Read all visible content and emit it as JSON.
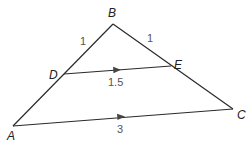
{
  "figure": {
    "type": "triangle-with-midsegment",
    "colors": {
      "line": "#2a2a2a",
      "vertex_label": "#222222",
      "length_label": "#555555",
      "background": "#ffffff"
    },
    "vertices": {
      "A": {
        "label": "A",
        "x": 13,
        "y": 126
      },
      "B": {
        "label": "B",
        "x": 113,
        "y": 24
      },
      "C": {
        "label": "C",
        "x": 233,
        "y": 109
      },
      "D": {
        "label": "D",
        "x": 64,
        "y": 74
      },
      "E": {
        "label": "E",
        "x": 171,
        "y": 66
      }
    },
    "segments": [
      {
        "name": "BD",
        "length_label": "1"
      },
      {
        "name": "BE",
        "length_label": "1"
      },
      {
        "name": "DE",
        "length_label": "1.5",
        "parallel_mark": true
      },
      {
        "name": "AC",
        "length_label": "3",
        "parallel_mark": true
      }
    ],
    "labels": {
      "A": "A",
      "B": "B",
      "C": "C",
      "D": "D",
      "E": "E",
      "BD": "1",
      "BE": "1",
      "DE": "1.5",
      "AC": "3"
    }
  }
}
